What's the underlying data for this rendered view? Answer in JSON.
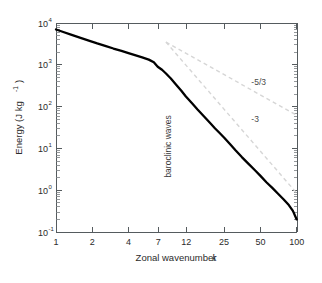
{
  "chart_data": {
    "type": "line",
    "title": "",
    "xlabel": "Zonal wavenumber k",
    "xlabel_text": "Zonal wavenumber",
    "xlabel_symbol": "k",
    "ylabel": "Energy (J kg-1)",
    "ylabel_text": "Energy (J kg",
    "ylabel_exp": "-1",
    "ylabel_close": ")",
    "xscale": "log",
    "yscale": "log",
    "xlim": [
      1,
      100
    ],
    "ylim": [
      0.1,
      10000
    ],
    "grid": false,
    "legend": null,
    "xticks": [
      {
        "value": 1,
        "label": "1"
      },
      {
        "value": 2,
        "label": "2"
      },
      {
        "value": 4,
        "label": "4"
      },
      {
        "value": 7,
        "label": "7"
      },
      {
        "value": 12,
        "label": "12"
      },
      {
        "value": 25,
        "label": "25"
      },
      {
        "value": 50,
        "label": "50"
      },
      {
        "value": 100,
        "label": "100"
      }
    ],
    "yticks": [
      {
        "value": 0.1,
        "mantissa": "10",
        "exponent": "-1"
      },
      {
        "value": 1,
        "mantissa": "10",
        "exponent": "0"
      },
      {
        "value": 10,
        "mantissa": "10",
        "exponent": "1"
      },
      {
        "value": 100,
        "mantissa": "10",
        "exponent": "2"
      },
      {
        "value": 1000,
        "mantissa": "10",
        "exponent": "3"
      },
      {
        "value": 10000,
        "mantissa": "10",
        "exponent": "4"
      }
    ],
    "series": [
      {
        "name": "kinetic energy spectrum",
        "style": "solid",
        "color": "#000000",
        "points": [
          [
            1,
            7000
          ],
          [
            1.15,
            6100
          ],
          [
            1.35,
            5200
          ],
          [
            1.6,
            4400
          ],
          [
            1.9,
            3750
          ],
          [
            2.2,
            3250
          ],
          [
            2.6,
            2800
          ],
          [
            3.0,
            2450
          ],
          [
            3.5,
            2150
          ],
          [
            4.0,
            1900
          ],
          [
            4.6,
            1680
          ],
          [
            5.2,
            1500
          ],
          [
            5.9,
            1330
          ],
          [
            6.5,
            1150
          ],
          [
            7.0,
            900
          ],
          [
            7.6,
            760
          ],
          [
            8.2,
            620
          ],
          [
            9.0,
            470
          ],
          [
            10.0,
            330
          ],
          [
            11.0,
            240
          ],
          [
            12.0,
            175
          ],
          [
            13.5,
            120
          ],
          [
            15.0,
            85
          ],
          [
            17.0,
            58
          ],
          [
            19.0,
            41
          ],
          [
            21.0,
            30
          ],
          [
            23.0,
            23
          ],
          [
            25.0,
            18
          ],
          [
            28.0,
            12.5
          ],
          [
            31.0,
            9.0
          ],
          [
            35.0,
            6.2
          ],
          [
            40.0,
            4.2
          ],
          [
            45.0,
            3.0
          ],
          [
            50.0,
            2.2
          ],
          [
            56.0,
            1.55
          ],
          [
            63.0,
            1.12
          ],
          [
            70.0,
            0.82
          ],
          [
            78.0,
            0.6
          ],
          [
            86.0,
            0.44
          ],
          [
            93.0,
            0.32
          ],
          [
            100.0,
            0.2
          ]
        ]
      }
    ],
    "reference_lines": [
      {
        "name": "minus-five-thirds-slope",
        "label": "-5/3",
        "slope": -1.6667,
        "style": "dashed",
        "color": "#d6d6d6",
        "x_start": 8.2,
        "y_start": 3500,
        "x_end": 100,
        "y_end": 62,
        "label_x": 42,
        "label_y": 330
      },
      {
        "name": "minus-three-slope",
        "label": "-3",
        "slope": -3,
        "style": "dashed",
        "color": "#d6d6d6",
        "x_start": 8.2,
        "y_start": 3500,
        "x_end": 100,
        "y_end": 0.85,
        "label_x": 42,
        "label_y": 42
      }
    ],
    "annotations": [
      {
        "name": "baroclinic-waves-label",
        "text": "baroclinic waves",
        "orientation": "vertical",
        "x": 9.0,
        "y": 2.0
      }
    ]
  }
}
